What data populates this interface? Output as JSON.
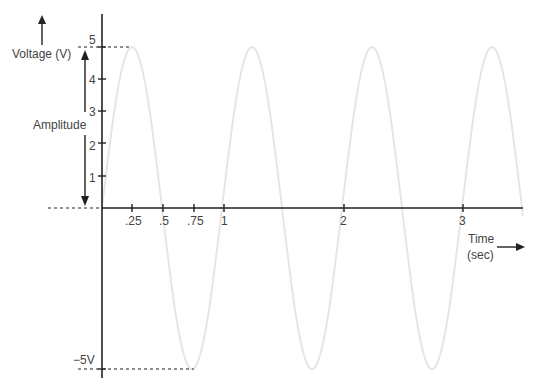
{
  "chart_data": {
    "type": "line",
    "title": "",
    "xlabel": "Time (sec)",
    "ylabel": "Voltage (V)",
    "xlim": [
      0,
      3.5
    ],
    "ylim": [
      -5,
      5
    ],
    "grid": false,
    "legend": null,
    "x_ticks": [
      {
        "value": 0.25,
        "label": ".25"
      },
      {
        "value": 0.5,
        "label": ".5"
      },
      {
        "value": 0.75,
        "label": ".75"
      },
      {
        "value": 1,
        "label": "1"
      },
      {
        "value": 2,
        "label": "2"
      },
      {
        "value": 3,
        "label": "3"
      }
    ],
    "y_ticks": [
      {
        "value": 1,
        "label": "1"
      },
      {
        "value": 2,
        "label": "2"
      },
      {
        "value": 3,
        "label": "3"
      },
      {
        "value": 4,
        "label": "4"
      },
      {
        "value": 5,
        "label": "5"
      },
      {
        "value": -5,
        "label": "−5V"
      }
    ],
    "series": [
      {
        "name": "sine wave",
        "function": "5*sin(2*pi*t)",
        "amplitude": 5,
        "period": 1,
        "frequency": 1,
        "color": "#e6e6e6",
        "x": [
          0,
          0.25,
          0.5,
          0.75,
          1,
          1.25,
          1.5,
          1.75,
          2,
          2.25,
          2.5,
          2.75,
          3,
          3.25,
          3.5
        ],
        "values": [
          0,
          5,
          0,
          -5,
          0,
          5,
          0,
          -5,
          0,
          5,
          0,
          -5,
          0,
          5,
          0
        ]
      }
    ],
    "annotations": [
      {
        "text": "Amplitude",
        "type": "double-arrow",
        "from": 0,
        "to": 5
      },
      {
        "text": "Voltage (V)",
        "type": "axis-label-with-up-arrow"
      },
      {
        "text": "Time (sec)",
        "type": "axis-label-with-right-arrow"
      },
      {
        "type": "dashed-line",
        "y": 5,
        "from_x": "left",
        "to_x": 0.25
      },
      {
        "type": "dashed-line",
        "y": 0,
        "from_x": "left",
        "to_x": 0
      },
      {
        "type": "dashed-line",
        "y": -5,
        "from_x": "left",
        "to_x": 0.75
      }
    ]
  },
  "labels": {
    "voltage": "Voltage (V)",
    "amplitude": "Amplitude",
    "time_line1": "Time",
    "time_line2": "(sec)",
    "neg5": "−5V",
    "y5": "5",
    "y4": "4",
    "y3": "3",
    "y2": "2",
    "y1": "1",
    "x025": ".25",
    "x05": ".5",
    "x075": ".75",
    "x1": "1",
    "x2": "2",
    "x3": "3"
  }
}
